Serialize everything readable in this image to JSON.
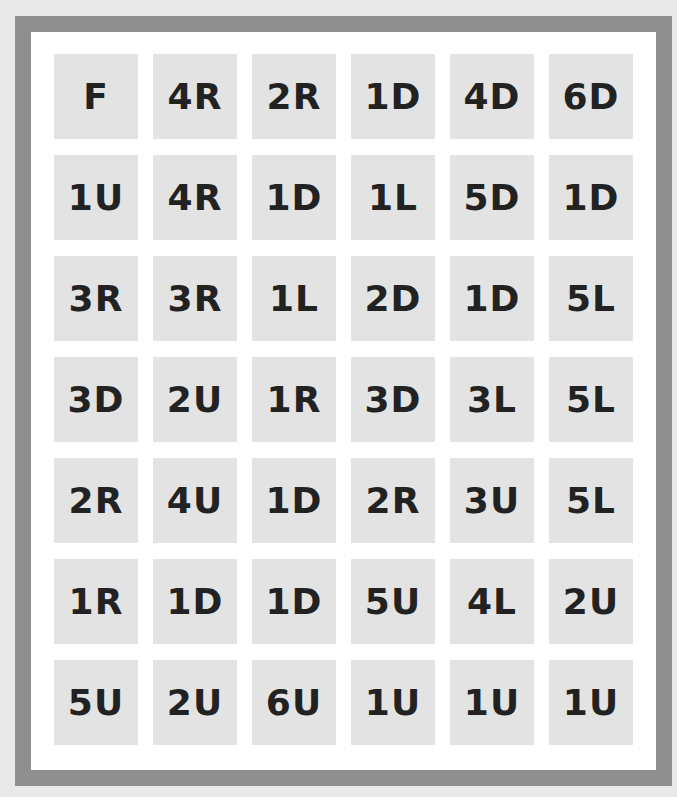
{
  "puzzle": {
    "rows": 7,
    "cols": 6,
    "cells": [
      [
        "F",
        "4R",
        "2R",
        "1D",
        "4D",
        "6D"
      ],
      [
        "1U",
        "4R",
        "1D",
        "1L",
        "5D",
        "1D"
      ],
      [
        "3R",
        "3R",
        "1L",
        "2D",
        "1D",
        "5L"
      ],
      [
        "3D",
        "2U",
        "1R",
        "3D",
        "3L",
        "5L"
      ],
      [
        "2R",
        "4U",
        "1D",
        "2R",
        "3U",
        "5L"
      ],
      [
        "1R",
        "1D",
        "1D",
        "5U",
        "4L",
        "2U"
      ],
      [
        "5U",
        "2U",
        "6U",
        "1U",
        "1U",
        "1U"
      ]
    ]
  },
  "colors": {
    "border": "#8f8f8f",
    "cell_bg": "#e3e3e3",
    "text": "#222222",
    "page_bg": "#e9e9e9"
  }
}
